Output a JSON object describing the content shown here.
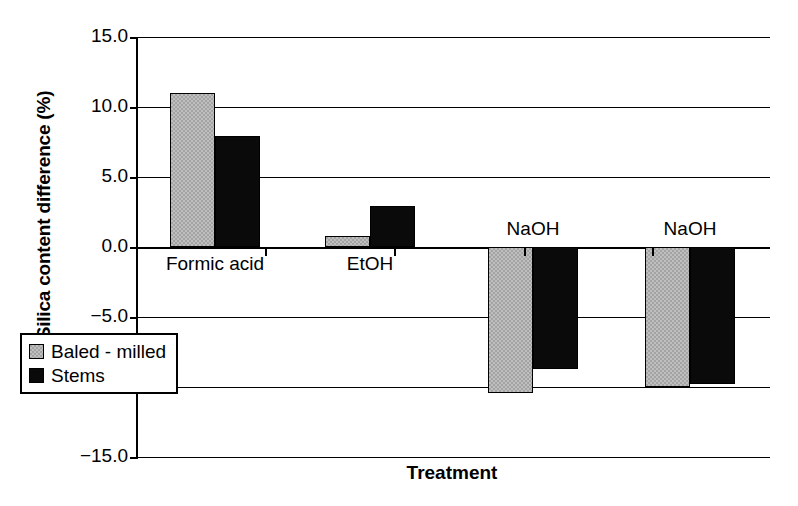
{
  "chart_data": {
    "type": "bar",
    "title": "",
    "xlabel": "Treatment",
    "ylabel": "Silica content difference (%)",
    "categories": [
      "Formic acid",
      "EtOH",
      "NaOH",
      "NaOH"
    ],
    "series": [
      {
        "name": "Baled - milled",
        "color": "#a3a3a3",
        "values": [
          11.0,
          0.8,
          -10.4,
          -10.0
        ]
      },
      {
        "name": "Stems",
        "color": "#0a0a0a",
        "values": [
          7.9,
          2.9,
          -8.7,
          -9.8
        ]
      }
    ],
    "ylim": [
      -15.0,
      15.0
    ],
    "yticks": [
      15.0,
      10.0,
      5.0,
      0.0,
      -5.0,
      -10.0,
      -15.0
    ],
    "ytick_labels": [
      "15.0",
      "10.0",
      "5.0",
      "0.0",
      "-5.0",
      "-10.0",
      "-15.0"
    ],
    "grid": true,
    "legend_position": "bottom-left"
  },
  "axes": {
    "y_title": "Silica content difference (%)",
    "x_title": "Treatment"
  },
  "legend": {
    "entries": [
      {
        "label": "Baled - milled"
      },
      {
        "label": "Stems"
      }
    ]
  }
}
